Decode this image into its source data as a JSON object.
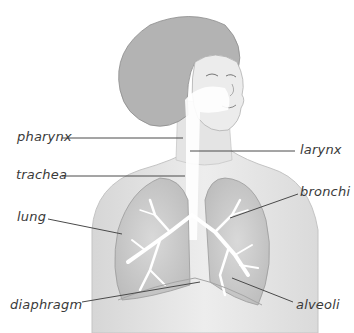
{
  "diagram": {
    "colors": {
      "skin": "#e6e6e6",
      "hair": "#a8a8a8",
      "lung": "#cfcfcf",
      "airway": "#ffffff",
      "leader_line": "#4a4a4a",
      "text": "#3a3a3a"
    },
    "labels": [
      {
        "id": "pharynx",
        "text": "pharynx",
        "side": "left"
      },
      {
        "id": "larynx",
        "text": "larynx",
        "side": "right"
      },
      {
        "id": "trachea",
        "text": "trachea",
        "side": "left"
      },
      {
        "id": "bronchi",
        "text": "bronchi",
        "side": "right"
      },
      {
        "id": "lung",
        "text": "lung",
        "side": "left"
      },
      {
        "id": "diaphragm",
        "text": "diaphragm",
        "side": "left"
      },
      {
        "id": "alveoli",
        "text": "alveoli",
        "side": "right"
      }
    ]
  }
}
